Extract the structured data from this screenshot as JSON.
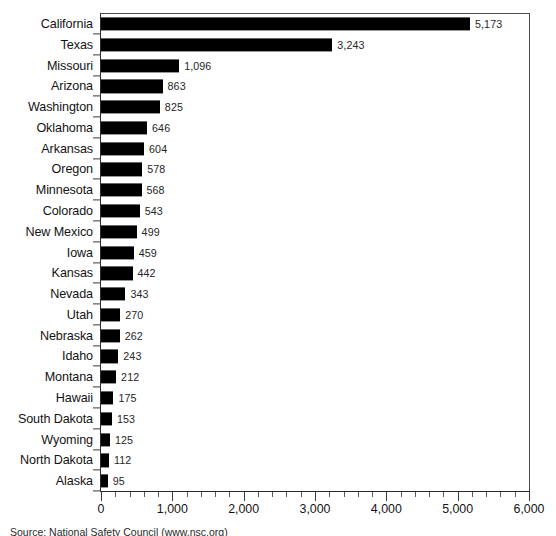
{
  "chart_data": {
    "type": "bar",
    "orientation": "horizontal",
    "title": "",
    "xlabel": "",
    "ylabel": "",
    "xlim": [
      0,
      6000
    ],
    "grid": false,
    "legend": null,
    "x_major_step": 1000,
    "x_minor_step": 200,
    "categories": [
      "California",
      "Texas",
      "Missouri",
      "Arizona",
      "Washington",
      "Oklahoma",
      "Arkansas",
      "Oregon",
      "Minnesota",
      "Colorado",
      "New Mexico",
      "Iowa",
      "Kansas",
      "Nevada",
      "Utah",
      "Nebraska",
      "Idaho",
      "Montana",
      "Hawaii",
      "South Dakota",
      "Wyoming",
      "North Dakota",
      "Alaska"
    ],
    "values": [
      5173,
      3243,
      1096,
      863,
      825,
      646,
      604,
      578,
      568,
      543,
      499,
      459,
      442,
      343,
      270,
      262,
      243,
      212,
      175,
      153,
      125,
      112,
      95
    ],
    "value_labels": [
      "5,173",
      "3,243",
      "1,096",
      "863",
      "825",
      "646",
      "604",
      "578",
      "568",
      "543",
      "499",
      "459",
      "442",
      "343",
      "270",
      "262",
      "243",
      "212",
      "175",
      "153",
      "125",
      "112",
      "95"
    ],
    "x_tick_labels": [
      "0",
      "1,000",
      "2,000",
      "3,000",
      "4,000",
      "5,000",
      "6,000"
    ],
    "x_tick_values": [
      0,
      1000,
      2000,
      3000,
      4000,
      5000,
      6000
    ],
    "bar_color": "#000000",
    "axis_color": "#3a3a3a",
    "background_color": "#ffffff"
  },
  "footer": {
    "source_note": "Source: National Safety Council (www.nsc.org)"
  }
}
